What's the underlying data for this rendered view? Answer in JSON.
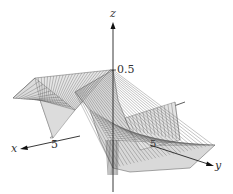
{
  "chart_data": {
    "type": "surface3d",
    "title": "",
    "axes": {
      "x": {
        "label": "x",
        "ticks": [
          "5"
        ]
      },
      "y": {
        "label": "y",
        "ticks": [
          "5"
        ]
      },
      "z": {
        "label": "z",
        "ticks": [
          "0.5"
        ]
      }
    },
    "surface": {
      "style": "wireframe mesh, light gray fill",
      "description": "Saddle-like twisted surface with a sharp ridge near the origin; peak value about 0.5 at the z-axis, flattening toward the edges with a fold along the x-direction and a trough dipping below zero near the origin on the y side",
      "z_max_approx": 0.5,
      "z_min_approx": -0.5
    },
    "colors": {
      "mesh": "#555555",
      "fill": "#e8e8e8",
      "axis": "#222222"
    }
  }
}
